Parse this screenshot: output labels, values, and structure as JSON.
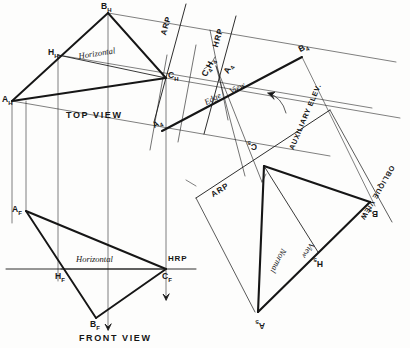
{
  "drawing": {
    "title": "Descriptive geometry: plane ABC true-size construction",
    "ink": "#161616",
    "paper": "#fdfdfc"
  },
  "views": {
    "top": {
      "name": "TOP VIEW",
      "horizontal_label": "Horizontal",
      "vertices": [
        {
          "id": "A_H",
          "base": "A",
          "sub": "H"
        },
        {
          "id": "B_H",
          "base": "B",
          "sub": "H"
        },
        {
          "id": "C_H",
          "base": "C",
          "sub": "H"
        },
        {
          "id": "H_H",
          "base": "H",
          "sub": "H"
        }
      ]
    },
    "front": {
      "name": "FRONT VIEW",
      "horizontal_label": "Horizontal",
      "vertices": [
        {
          "id": "A_F",
          "base": "A",
          "sub": "F"
        },
        {
          "id": "B_F",
          "base": "B",
          "sub": "F"
        },
        {
          "id": "C_F",
          "base": "C",
          "sub": "F"
        },
        {
          "id": "H_F",
          "base": "H",
          "sub": "F"
        }
      ]
    },
    "auxiliary": {
      "name": "AUXILIARY ELEV.",
      "edge_label": "Edge",
      "view_label": "View",
      "vertices": [
        {
          "id": "A_4",
          "base": "A",
          "sub": "4"
        },
        {
          "id": "B_4",
          "base": "B",
          "sub": "4"
        },
        {
          "id": "C4H4",
          "base": "C",
          "sub": "4"
        },
        {
          "id": "H_4",
          "base": "H",
          "sub": "4"
        }
      ]
    },
    "oblique": {
      "name": "OBLIQUE VIEW",
      "normal_label": "Normal",
      "view_label": "View",
      "vertices": [
        {
          "id": "A_5",
          "base": "A",
          "sub": "5"
        },
        {
          "id": "B_5",
          "base": "B",
          "sub": "5"
        },
        {
          "id": "C_5",
          "base": "C",
          "sub": "5"
        },
        {
          "id": "H_5",
          "base": "H",
          "sub": "5"
        }
      ]
    }
  },
  "reference_planes": {
    "hrp_top": "HRP",
    "hrp_front": "HRP",
    "arp_top": "ARP",
    "arp_oblique": "ARP"
  }
}
